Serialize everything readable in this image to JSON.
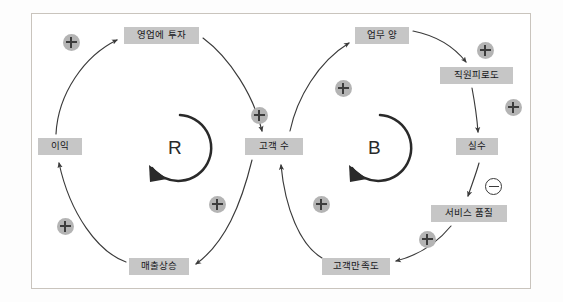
{
  "diagram": {
    "frame": {
      "border_color": "#c9c4bd",
      "background": "#ffffff"
    },
    "palette": {
      "node_fill": "#c6c6c6",
      "node_text": "#17171b",
      "plus_badge_fill": "#b4b4b4",
      "minus_badge_fill": "#ffffff",
      "arrow_color": "#3a3a3a",
      "loop_color": "#2a2a2a"
    },
    "nodes": [
      {
        "id": "invest-in-sales",
        "label": "영업에 투자",
        "x": 124,
        "y": 27,
        "w": 75,
        "h": 17
      },
      {
        "id": "profit",
        "label": "이익",
        "x": 38,
        "y": 138,
        "w": 44,
        "h": 17
      },
      {
        "id": "sales-increase",
        "label": "매출상승",
        "x": 129,
        "y": 258,
        "w": 60,
        "h": 17
      },
      {
        "id": "customer-count",
        "label": "고객 수",
        "x": 245,
        "y": 138,
        "w": 58,
        "h": 17
      },
      {
        "id": "workload",
        "label": "업무 양",
        "x": 355,
        "y": 27,
        "w": 54,
        "h": 17
      },
      {
        "id": "staff-fatigue",
        "label": "직원피로도",
        "x": 440,
        "y": 67,
        "w": 73,
        "h": 17
      },
      {
        "id": "mistakes",
        "label": "실수",
        "x": 456,
        "y": 138,
        "w": 42,
        "h": 17
      },
      {
        "id": "service-quality",
        "label": "서비스 품질",
        "x": 431,
        "y": 205,
        "w": 76,
        "h": 17
      },
      {
        "id": "customer-satisfaction",
        "label": "고객만족도",
        "x": 322,
        "y": 258,
        "w": 68,
        "h": 17
      }
    ],
    "loops": [
      {
        "id": "reinforcing-loop",
        "label": "R",
        "cx": 175,
        "cy": 148,
        "r": 33,
        "type": "reinforcing"
      },
      {
        "id": "balancing-loop",
        "label": "B",
        "cx": 375,
        "cy": 148,
        "r": 33,
        "type": "balancing"
      }
    ],
    "polarities": [
      {
        "id": "polarity-profit-to-invest",
        "sign": "+",
        "x": 63,
        "y": 34
      },
      {
        "id": "polarity-invest-to-customers",
        "sign": "+",
        "x": 251,
        "y": 107
      },
      {
        "id": "polarity-customers-to-sales-increase",
        "sign": "+",
        "x": 209,
        "y": 196
      },
      {
        "id": "polarity-sales-increase-to-profit",
        "sign": "+",
        "x": 57,
        "y": 218
      },
      {
        "id": "polarity-customers-to-workload",
        "sign": "+",
        "x": 335,
        "y": 80
      },
      {
        "id": "polarity-workload-to-fatigue",
        "sign": "+",
        "x": 477,
        "y": 42
      },
      {
        "id": "polarity-fatigue-to-mistakes",
        "sign": "+",
        "x": 505,
        "y": 99
      },
      {
        "id": "polarity-mistakes-to-service-quality",
        "sign": "-",
        "x": 485,
        "y": 178
      },
      {
        "id": "polarity-quality-to-satisfaction",
        "sign": "+",
        "x": 419,
        "y": 231
      },
      {
        "id": "polarity-satisfaction-to-customers",
        "sign": "+",
        "x": 313,
        "y": 196
      }
    ],
    "links": [
      {
        "id": "link-profit-to-invest",
        "from": "profit",
        "to": "invest-in-sales",
        "sign": "+"
      },
      {
        "id": "link-invest-to-customers",
        "from": "invest-in-sales",
        "to": "customer-count",
        "sign": "+"
      },
      {
        "id": "link-customers-to-sales-increase",
        "from": "customer-count",
        "to": "sales-increase",
        "sign": "+"
      },
      {
        "id": "link-sales-increase-to-profit",
        "from": "sales-increase",
        "to": "profit",
        "sign": "+"
      },
      {
        "id": "link-customers-to-workload",
        "from": "customer-count",
        "to": "workload",
        "sign": "+"
      },
      {
        "id": "link-workload-to-fatigue",
        "from": "workload",
        "to": "staff-fatigue",
        "sign": "+"
      },
      {
        "id": "link-fatigue-to-mistakes",
        "from": "staff-fatigue",
        "to": "mistakes",
        "sign": "+"
      },
      {
        "id": "link-mistakes-to-service-quality",
        "from": "mistakes",
        "to": "service-quality",
        "sign": "-"
      },
      {
        "id": "link-quality-to-satisfaction",
        "from": "service-quality",
        "to": "customer-satisfaction",
        "sign": "+"
      },
      {
        "id": "link-satisfaction-to-customers",
        "from": "customer-satisfaction",
        "to": "customer-count",
        "sign": "+"
      }
    ]
  }
}
